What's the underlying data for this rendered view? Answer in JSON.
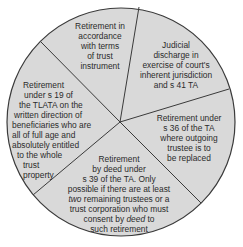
{
  "diagram": {
    "type": "pie-segments",
    "colors": {
      "fill": "#d9d9d9",
      "stroke": "#3a3a3a",
      "text": "#2b2b2b",
      "background": "#ffffff"
    },
    "segments": [
      {
        "id": "top",
        "text": "Retirement in\naccordance\nwith terms\nof trust\ninstrument"
      },
      {
        "id": "upper-right",
        "text": "Judicial\ndischarge in\nexercise of court's\ninherent jurisdiction\nand s 41 TA"
      },
      {
        "id": "lower-right",
        "text": "Retirement under\ns 36 of the TA\nwhere outgoing\ntrustee is to\nbe replaced"
      },
      {
        "id": "bottom",
        "text_parts": [
          "Retirement\nby deed under\ns 39 of the TA. Only\npossible if there are at least\n",
          "two",
          " remaining trustees or a\ntrust corporation who must\nconsent by ",
          "deed",
          " to\nsuch retirement"
        ]
      },
      {
        "id": "left",
        "text": "Retirement\nunder s 19 of\nthe TLATA on the\nwritten direction of\nbeneficiaries who are\nall of full age and\nabsolutely entitled\nto the whole\ntrust\nproperty"
      }
    ]
  }
}
